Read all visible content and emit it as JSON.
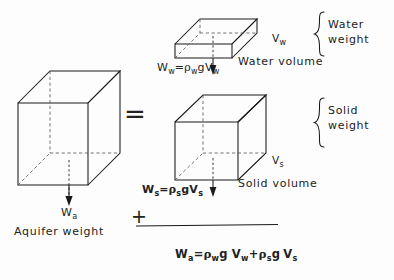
{
  "figure": {
    "type": "aquifer-weight-decomposition-diagram",
    "left": {
      "shape_name": "aquifer-block",
      "force_label": "W",
      "force_subscript": "a",
      "caption": "Aquifer weight"
    },
    "operator_equals": "=",
    "operator_plus": "+",
    "water": {
      "shape_name": "water-slab",
      "equation_lhs": "W",
      "equation_lhs_sub": "w",
      "equation_rel": "=",
      "equation_rho": "ρ",
      "equation_rho_sub": "w",
      "equation_g": "g",
      "equation_v": "V",
      "equation_v_sub": "w",
      "volume_symbol": "V",
      "volume_symbol_sub": "w",
      "volume_caption": "Water volume",
      "brace_label_line1": "Water",
      "brace_label_line2": "weight"
    },
    "solid": {
      "shape_name": "solid-cube",
      "equation_lhs": "W",
      "equation_lhs_sub": "s",
      "equation_rel": "=",
      "equation_rho": "ρ",
      "equation_rho_sub": "s",
      "equation_g": "g",
      "equation_v": "V",
      "equation_v_sub": "s",
      "volume_symbol": "V",
      "volume_symbol_sub": "s",
      "volume_caption": "Solid volume",
      "brace_label_line1": "Solid",
      "brace_label_line2": "weight"
    },
    "result_equation": {
      "lhs": "W",
      "lhs_sub": "a",
      "rel": "=",
      "term1_rho": "ρ",
      "term1_rho_sub": "w",
      "term1_g": "g",
      "term1_v": "V",
      "term1_v_sub": "w",
      "operator": "+",
      "term2_rho": "ρ",
      "term2_rho_sub": "s",
      "term2_g": "g",
      "term2_v": "V",
      "term2_v_sub": "s"
    },
    "colors": {
      "ink": "#1a1a1a",
      "background": "#fdfdfd",
      "dashed": "#555555"
    }
  }
}
